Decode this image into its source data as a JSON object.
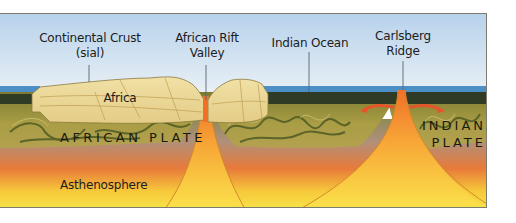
{
  "diagram": {
    "type": "geological cross-section",
    "colors": {
      "sky_top": "#b9d3ec",
      "sky_bottom": "#eef3f7",
      "ocean": "#4a90c8",
      "oceanic_crust": "#2e3a22",
      "continental_crust": "#efdda0",
      "lithosphere": "#a89a3c",
      "asthenosphere_top": "#e8783a",
      "asthenosphere_bottom": "#f8e040",
      "magma": "#f59030",
      "frame": "#7b7b6f"
    },
    "labels": {
      "continental_crust": [
        "Continental Crust",
        "(sial)"
      ],
      "rift_valley": [
        "African Rift",
        "Valley"
      ],
      "indian_ocean": "Indian Ocean",
      "carlsberg_ridge": [
        "Carlsberg",
        "Ridge"
      ],
      "africa": "Africa",
      "african_plate": "AFRICAN PLATE",
      "indian_plate": [
        "INDIAN",
        "PLATE"
      ],
      "asthenosphere": "Asthenosphere"
    }
  }
}
